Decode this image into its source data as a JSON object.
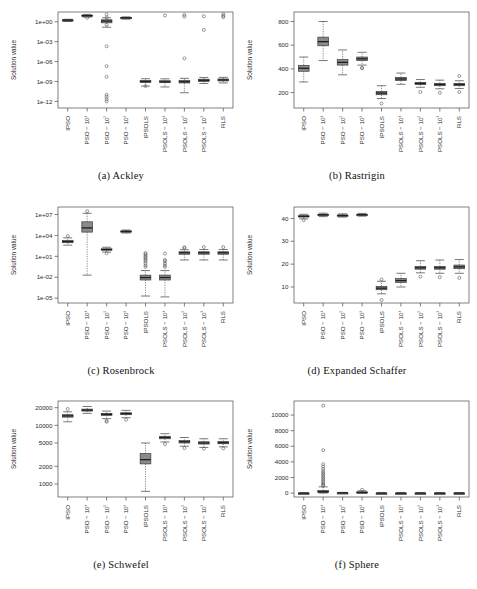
{
  "figure": {
    "categories": [
      "IPSO",
      "PSO − 10¹",
      "PSO − 10²",
      "PSO − 10³",
      "IPSOLS",
      "PSOLS − 10¹",
      "PSOLS − 10²",
      "PSOLS − 10³",
      "RLS"
    ],
    "ylabel": "Solution value",
    "box_fill": "#8a8a8a",
    "box_stroke": "#3c3c3c",
    "axis_color": "#4a4a4a"
  },
  "chart_data": [
    {
      "id": "ackley",
      "type": "box",
      "title": "(a) Ackley",
      "caption_index": "(a)",
      "caption_name": "Ackley",
      "xlabel": "",
      "ylabel": "Solution value",
      "yscale": "log",
      "ylim": [
        1e-13,
        30.0
      ],
      "yticks": [
        1,
        0.001,
        1e-06,
        1e-09,
        1e-12
      ],
      "yticklabels": [
        "1e+00",
        "1e-03",
        "1e-06",
        "1e-09",
        "1e-12"
      ],
      "categories": [
        "IPSO",
        "PSO − 10¹",
        "PSO − 10²",
        "PSO − 10³",
        "IPSOLS",
        "PSOLS − 10¹",
        "PSOLS − 10²",
        "PSOLS − 10³",
        "RLS"
      ],
      "boxes": [
        {
          "cat": "IPSO",
          "whisker_low": 1.1,
          "q1": 1.5,
          "median": 1.8,
          "q3": 2.0,
          "whisker_high": 2.4,
          "outliers": []
        },
        {
          "cat": "PSO − 10¹",
          "whisker_low": 5.0,
          "q1": 7.0,
          "median": 8.5,
          "q3": 10.0,
          "whisker_high": 13.0,
          "outliers": [
            4.0
          ]
        },
        {
          "cat": "PSO − 10²",
          "whisker_low": 0.15,
          "q1": 0.7,
          "median": 1.3,
          "q3": 2.0,
          "whisker_high": 4.0,
          "outliers": [
            13.0,
            4.5,
            0.35,
            0.0002,
            2e-07,
            5e-09,
            1e-11,
            5e-12,
            2e-12,
            1e-12
          ]
        },
        {
          "cat": "PSO − 10³",
          "whisker_low": 2.5,
          "q1": 3.4,
          "median": 4.0,
          "q3": 4.6,
          "whisker_high": 5.5,
          "outliers": []
        },
        {
          "cat": "IPSOLS",
          "whisker_low": 2e-10,
          "q1": 7e-10,
          "median": 1e-09,
          "q3": 1.4e-09,
          "whisker_high": 2.6e-09,
          "outliers": [
            2e-10
          ]
        },
        {
          "cat": "PSOLS − 10¹",
          "whisker_low": 1.5e-10,
          "q1": 7e-10,
          "median": 9e-10,
          "q3": 1.3e-09,
          "whisker_high": 2.5e-09,
          "outliers": [
            9.0
          ]
        },
        {
          "cat": "PSOLS − 10²",
          "whisker_low": 2e-11,
          "q1": 6e-10,
          "median": 9e-10,
          "q3": 1.5e-09,
          "whisker_high": 3e-09,
          "outliers": [
            11.0,
            6.0,
            3e-06
          ]
        },
        {
          "cat": "PSOLS − 10³",
          "whisker_low": 5e-10,
          "q1": 1e-09,
          "median": 1.5e-09,
          "q3": 2.2e-09,
          "whisker_high": 4e-09,
          "outliers": [
            7.0,
            0.06
          ]
        },
        {
          "cat": "RLS",
          "whisker_low": 6e-10,
          "q1": 1.2e-09,
          "median": 1.7e-09,
          "q3": 2.4e-09,
          "whisker_high": 4.2e-09,
          "outliers": [
            14.0,
            8.0,
            5.0
          ]
        }
      ]
    },
    {
      "id": "rastrigin",
      "type": "box",
      "title": "(b) Rastrigin",
      "caption_index": "(b)",
      "caption_name": "Rastrigin",
      "xlabel": "",
      "ylabel": "Solution value",
      "yscale": "linear",
      "ylim": [
        70,
        880
      ],
      "yticks": [
        200,
        400,
        600,
        800
      ],
      "yticklabels": [
        "200",
        "400",
        "600",
        "800"
      ],
      "categories": [
        "IPSO",
        "PSO − 10¹",
        "PSO − 10²",
        "PSO − 10³",
        "IPSOLS",
        "PSOLS − 10¹",
        "PSOLS − 10²",
        "PSOLS − 10³",
        "RLS"
      ],
      "boxes": [
        {
          "cat": "IPSO",
          "whisker_low": 290,
          "q1": 380,
          "median": 405,
          "q3": 430,
          "whisker_high": 500,
          "outliers": []
        },
        {
          "cat": "PSO − 10¹",
          "whisker_low": 470,
          "q1": 595,
          "median": 630,
          "q3": 668,
          "whisker_high": 800,
          "outliers": []
        },
        {
          "cat": "PSO − 10²",
          "whisker_low": 350,
          "q1": 432,
          "median": 455,
          "q3": 478,
          "whisker_high": 560,
          "outliers": []
        },
        {
          "cat": "PSO − 10³",
          "whisker_low": 432,
          "q1": 470,
          "median": 485,
          "q3": 500,
          "whisker_high": 540,
          "outliers": [
            410,
            405
          ]
        },
        {
          "cat": "IPSOLS",
          "whisker_low": 150,
          "q1": 182,
          "median": 196,
          "q3": 210,
          "whisker_high": 258,
          "outliers": [
            108
          ]
        },
        {
          "cat": "PSOLS − 10¹",
          "whisker_low": 270,
          "q1": 302,
          "median": 315,
          "q3": 328,
          "whisker_high": 365,
          "outliers": []
        },
        {
          "cat": "PSOLS − 10²",
          "whisker_low": 245,
          "q1": 268,
          "median": 277,
          "q3": 286,
          "whisker_high": 310,
          "outliers": [
            205
          ]
        },
        {
          "cat": "PSOLS − 10³",
          "whisker_low": 232,
          "q1": 258,
          "median": 268,
          "q3": 278,
          "whisker_high": 305,
          "outliers": [
            198
          ]
        },
        {
          "cat": "RLS",
          "whisker_low": 235,
          "q1": 258,
          "median": 268,
          "q3": 278,
          "whisker_high": 300,
          "outliers": [
            340,
            205
          ]
        }
      ]
    },
    {
      "id": "rosenbrock",
      "type": "box",
      "title": "(c) Rosenbrock",
      "caption_index": "(c)",
      "caption_name": "Rosenbrock",
      "xlabel": "",
      "ylabel": "Solution value",
      "yscale": "log",
      "ylim": [
        2e-06,
        120000000.0
      ],
      "yticks": [
        10000000.0,
        10000.0,
        10,
        0.01,
        1e-05
      ],
      "yticklabels": [
        "1e+07",
        "1e+04",
        "1e+01",
        "1e-02",
        "1e-05"
      ],
      "categories": [
        "IPSO",
        "PSO − 10¹",
        "PSO − 10²",
        "PSO − 10³",
        "IPSOLS",
        "PSOLS − 10¹",
        "PSOLS − 10²",
        "PSOLS − 10³",
        "RLS"
      ],
      "boxes": [
        {
          "cat": "IPSO",
          "whisker_low": 400,
          "q1": 900,
          "median": 1300,
          "q3": 1900,
          "whisker_high": 4500,
          "outliers": [
            8000
          ]
        },
        {
          "cat": "PSO − 10¹",
          "whisker_low": 0.02,
          "q1": 30000,
          "median": 120000,
          "q3": 900000,
          "whisker_high": 15000000,
          "outliers": [
            30000000
          ]
        },
        {
          "cat": "PSO − 10²",
          "whisker_low": 40,
          "q1": 75,
          "median": 95,
          "q3": 120,
          "whisker_high": 200,
          "outliers": [
            28
          ]
        },
        {
          "cat": "PSO − 10³",
          "whisker_low": 22000,
          "q1": 32000,
          "median": 38000,
          "q3": 44000,
          "whisker_high": 60000,
          "outliers": []
        },
        {
          "cat": "IPSOLS",
          "whisker_low": 2e-05,
          "q1": 0.004,
          "median": 0.009,
          "q3": 0.02,
          "whisker_high": 0.09,
          "outliers": [
            30,
            20,
            12,
            8,
            5,
            3,
            2,
            1,
            0.5,
            0.3
          ]
        },
        {
          "cat": "PSOLS − 10¹",
          "whisker_low": 1.5e-05,
          "q1": 0.004,
          "median": 0.009,
          "q3": 0.02,
          "whisker_high": 0.09,
          "outliers": [
            25,
            3,
            2,
            1,
            0.5,
            0.3
          ]
        },
        {
          "cat": "PSOLS − 10²",
          "whisker_low": 3,
          "q1": 20,
          "median": 32,
          "q3": 45,
          "whisker_high": 90,
          "outliers": [
            200,
            150
          ]
        },
        {
          "cat": "PSOLS − 10³",
          "whisker_low": 3,
          "q1": 20,
          "median": 32,
          "q3": 45,
          "whisker_high": 95,
          "outliers": [
            220
          ]
        },
        {
          "cat": "RLS",
          "whisker_low": 3,
          "q1": 20,
          "median": 32,
          "q3": 45,
          "whisker_high": 95,
          "outliers": [
            210
          ]
        }
      ]
    },
    {
      "id": "expanded-schaffer",
      "type": "box",
      "title": "(d) Expanded Schaffer",
      "caption_index": "(d)",
      "caption_name": "Expanded Schaffer",
      "xlabel": "",
      "ylabel": "Solution value",
      "yscale": "linear",
      "ylim": [
        3,
        45
      ],
      "yticks": [
        10,
        20,
        30,
        40
      ],
      "yticklabels": [
        "10",
        "20",
        "30",
        "40"
      ],
      "categories": [
        "IPSO",
        "PSO − 10¹",
        "PSO − 10²",
        "PSO − 10³",
        "IPSOLS",
        "PSOLS − 10¹",
        "PSOLS − 10²",
        "PSOLS − 10³",
        "RLS"
      ],
      "boxes": [
        {
          "cat": "IPSO",
          "whisker_low": 39.8,
          "q1": 40.6,
          "median": 40.9,
          "q3": 41.2,
          "whisker_high": 41.8,
          "outliers": [
            39.2
          ]
        },
        {
          "cat": "PSO − 10¹",
          "whisker_low": 40.8,
          "q1": 41.4,
          "median": 41.6,
          "q3": 41.8,
          "whisker_high": 42.3,
          "outliers": []
        },
        {
          "cat": "PSO − 10²",
          "whisker_low": 40.6,
          "q1": 41.1,
          "median": 41.3,
          "q3": 41.5,
          "whisker_high": 42.0,
          "outliers": []
        },
        {
          "cat": "PSO − 10³",
          "whisker_low": 41.0,
          "q1": 41.4,
          "median": 41.6,
          "q3": 41.8,
          "whisker_high": 42.2,
          "outliers": []
        },
        {
          "cat": "IPSOLS",
          "whisker_low": 7.0,
          "q1": 8.8,
          "median": 9.5,
          "q3": 10.3,
          "whisker_high": 12.5,
          "outliers": [
            13.3,
            4.3
          ]
        },
        {
          "cat": "PSOLS − 10¹",
          "whisker_low": 10.0,
          "q1": 12.0,
          "median": 12.8,
          "q3": 13.7,
          "whisker_high": 16.0,
          "outliers": []
        },
        {
          "cat": "PSOLS − 10²",
          "whisker_low": 16.2,
          "q1": 17.8,
          "median": 18.4,
          "q3": 19.0,
          "whisker_high": 21.5,
          "outliers": [
            14.5
          ]
        },
        {
          "cat": "PSOLS − 10³",
          "whisker_low": 16.0,
          "q1": 17.8,
          "median": 18.4,
          "q3": 19.0,
          "whisker_high": 21.8,
          "outliers": [
            14.3
          ]
        },
        {
          "cat": "RLS",
          "whisker_low": 16.0,
          "q1": 18.0,
          "median": 18.8,
          "q3": 19.6,
          "whisker_high": 22.0,
          "outliers": [
            14.0
          ]
        }
      ]
    },
    {
      "id": "schwefel",
      "type": "box",
      "title": "(e) Schwefel",
      "caption_index": "(e)",
      "caption_name": "Schwefel",
      "xlabel": "",
      "ylabel": "Solution value",
      "yscale": "log",
      "ylim": [
        600,
        26000
      ],
      "yticks": [
        1000,
        2000,
        5000,
        10000,
        20000
      ],
      "yticklabels": [
        "1000",
        "2000",
        "5000",
        "10000",
        "20000"
      ],
      "categories": [
        "IPSO",
        "PSO − 10¹",
        "PSO − 10²",
        "PSO − 10³",
        "IPSOLS",
        "PSOLS − 10¹",
        "PSOLS − 10²",
        "PSOLS − 10³",
        "RLS"
      ],
      "boxes": [
        {
          "cat": "IPSO",
          "whisker_low": 11500,
          "q1": 13800,
          "median": 14500,
          "q3": 15200,
          "whisker_high": 17000,
          "outliers": [
            19000
          ]
        },
        {
          "cat": "PSO − 10¹",
          "whisker_low": 16000,
          "q1": 17500,
          "median": 18200,
          "q3": 18900,
          "whisker_high": 21000,
          "outliers": []
        },
        {
          "cat": "PSO − 10²",
          "whisker_low": 13000,
          "q1": 14800,
          "median": 15400,
          "q3": 16000,
          "whisker_high": 17500,
          "outliers": [
            12000,
            11500
          ]
        },
        {
          "cat": "PSO − 10³",
          "whisker_low": 13500,
          "q1": 15200,
          "median": 15800,
          "q3": 16400,
          "whisker_high": 18000,
          "outliers": [
            12500
          ]
        },
        {
          "cat": "IPSOLS",
          "whisker_low": 750,
          "q1": 2200,
          "median": 2600,
          "q3": 3300,
          "whisker_high": 5000,
          "outliers": []
        },
        {
          "cat": "PSOLS − 10¹",
          "whisker_low": 5200,
          "q1": 5900,
          "median": 6200,
          "q3": 6500,
          "whisker_high": 7200,
          "outliers": [
            4800
          ]
        },
        {
          "cat": "PSOLS − 10²",
          "whisker_low": 4400,
          "q1": 5000,
          "median": 5250,
          "q3": 5500,
          "whisker_high": 6200,
          "outliers": [
            4100
          ]
        },
        {
          "cat": "PSOLS − 10³",
          "whisker_low": 4200,
          "q1": 4800,
          "median": 5000,
          "q3": 5250,
          "whisker_high": 5900,
          "outliers": [
            4000
          ]
        },
        {
          "cat": "RLS",
          "whisker_low": 4300,
          "q1": 4850,
          "median": 5050,
          "q3": 5300,
          "whisker_high": 5900,
          "outliers": [
            4050
          ]
        }
      ]
    },
    {
      "id": "sphere",
      "type": "box",
      "title": "(f) Sphere",
      "caption_index": "(f)",
      "caption_name": "Sphere",
      "xlabel": "",
      "ylabel": "Solution value",
      "yscale": "linear",
      "ylim": [
        -500,
        11800
      ],
      "yticks": [
        0,
        2000,
        4000,
        6000,
        8000,
        10000
      ],
      "yticklabels": [
        "0",
        "2000",
        "4000",
        "6000",
        "8000",
        "10000"
      ],
      "categories": [
        "IPSO",
        "PSO − 10¹",
        "PSO − 10²",
        "PSO − 10³",
        "IPSOLS",
        "PSOLS − 10¹",
        "PSOLS − 10²",
        "PSOLS − 10³",
        "RLS"
      ],
      "boxes": [
        {
          "cat": "IPSO",
          "whisker_low": 0,
          "q1": 0,
          "median": 0,
          "q3": 0,
          "whisker_high": 0,
          "outliers": []
        },
        {
          "cat": "PSO − 10¹",
          "whisker_low": 0,
          "q1": 60,
          "median": 180,
          "q3": 330,
          "whisker_high": 800,
          "outliers": [
            11200,
            5500,
            3700,
            3400,
            3100,
            2800,
            2600,
            2400,
            2200,
            2000,
            1800,
            1600,
            1400,
            1200,
            1050,
            950
          ]
        },
        {
          "cat": "PSO − 10²",
          "whisker_low": 0,
          "q1": 10,
          "median": 25,
          "q3": 45,
          "whisker_high": 90,
          "outliers": []
        },
        {
          "cat": "PSO − 10³",
          "whisker_low": 0,
          "q1": 40,
          "median": 90,
          "q3": 150,
          "whisker_high": 300,
          "outliers": [
            430
          ]
        },
        {
          "cat": "IPSOLS",
          "whisker_low": 0,
          "q1": 0,
          "median": 0,
          "q3": 0,
          "whisker_high": 0,
          "outliers": []
        },
        {
          "cat": "PSOLS − 10¹",
          "whisker_low": 0,
          "q1": 0,
          "median": 0,
          "q3": 0,
          "whisker_high": 0,
          "outliers": []
        },
        {
          "cat": "PSOLS − 10²",
          "whisker_low": 0,
          "q1": 0,
          "median": 0,
          "q3": 0,
          "whisker_high": 0,
          "outliers": []
        },
        {
          "cat": "PSOLS − 10³",
          "whisker_low": 0,
          "q1": 0,
          "median": 0,
          "q3": 0,
          "whisker_high": 0,
          "outliers": []
        },
        {
          "cat": "RLS",
          "whisker_low": 0,
          "q1": 0,
          "median": 0,
          "q3": 0,
          "whisker_high": 0,
          "outliers": []
        }
      ]
    }
  ]
}
